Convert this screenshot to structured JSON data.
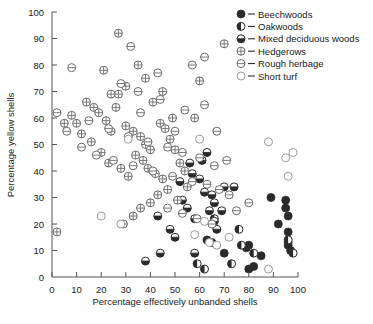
{
  "chart_data": {
    "type": "scatter",
    "title": "",
    "xlabel": "Percentage effectively unbanded shells",
    "ylabel": "Percentage yellow shells",
    "xlim": [
      0,
      100
    ],
    "ylim": [
      0,
      100
    ],
    "xticks": [
      0,
      10,
      20,
      30,
      40,
      50,
      60,
      70,
      80,
      90,
      100
    ],
    "yticks": [
      0,
      10,
      20,
      30,
      40,
      50,
      60,
      70,
      80,
      90,
      100
    ],
    "grid": false,
    "legend_position": "top-right",
    "series": [
      {
        "name": "Beechwoods",
        "marker": "filled-circle",
        "color": "#2b2b2b",
        "points": [
          [
            89,
            30
          ],
          [
            95,
            29
          ],
          [
            95,
            26
          ],
          [
            96,
            23
          ],
          [
            92,
            20
          ],
          [
            96,
            17
          ],
          [
            96,
            13
          ],
          [
            96,
            12
          ],
          [
            97,
            10
          ],
          [
            80,
            12
          ],
          [
            79,
            11
          ],
          [
            70,
            9
          ],
          [
            85,
            8
          ],
          [
            82,
            4
          ],
          [
            80,
            3
          ],
          [
            63,
            14
          ],
          [
            65,
            13
          ]
        ]
      },
      {
        "name": "Oakwoods",
        "marker": "half-left-circle",
        "color": "#2b2b2b",
        "points": [
          [
            76,
            18
          ],
          [
            77,
            12
          ],
          [
            82,
            9
          ],
          [
            73,
            5
          ],
          [
            62,
            3
          ],
          [
            66,
            22
          ],
          [
            59,
            5
          ],
          [
            96,
            14
          ],
          [
            98,
            9
          ]
        ]
      },
      {
        "name": "Mixed deciduous woods",
        "marker": "half-bottom-circle",
        "color": "#2b2b2b",
        "points": [
          [
            60,
            37
          ],
          [
            62,
            32
          ],
          [
            65,
            31
          ],
          [
            66,
            28
          ],
          [
            64,
            25
          ],
          [
            58,
            22
          ],
          [
            66,
            21
          ],
          [
            67,
            18
          ],
          [
            69,
            25
          ],
          [
            70,
            34
          ],
          [
            56,
            43
          ],
          [
            57,
            39
          ],
          [
            52,
            36
          ],
          [
            53,
            29
          ],
          [
            55,
            26
          ],
          [
            48,
            18
          ],
          [
            50,
            15
          ],
          [
            44,
            9
          ],
          [
            58,
            9
          ],
          [
            43,
            23
          ],
          [
            74,
            34
          ],
          [
            63,
            47
          ],
          [
            38,
            6
          ],
          [
            61,
            44
          ]
        ]
      },
      {
        "name": "Hedgerows",
        "marker": "crossed-circle",
        "color": "#6b6b6b",
        "points": [
          [
            27,
            92
          ],
          [
            35,
            80
          ],
          [
            30,
            72
          ],
          [
            27,
            69
          ],
          [
            24,
            69
          ],
          [
            5,
            58
          ],
          [
            2,
            17
          ],
          [
            10,
            58
          ],
          [
            14,
            66
          ],
          [
            17,
            64
          ],
          [
            19,
            62
          ],
          [
            22,
            59
          ],
          [
            24,
            55
          ],
          [
            30,
            57
          ],
          [
            33,
            55
          ],
          [
            36,
            53
          ],
          [
            38,
            50
          ],
          [
            40,
            48
          ],
          [
            44,
            58
          ],
          [
            46,
            56
          ],
          [
            48,
            52
          ],
          [
            50,
            48
          ],
          [
            34,
            46
          ],
          [
            37,
            44
          ],
          [
            39,
            41
          ],
          [
            42,
            39
          ],
          [
            45,
            37
          ],
          [
            31,
            38
          ],
          [
            28,
            41
          ],
          [
            23,
            43
          ],
          [
            20,
            47
          ],
          [
            16,
            51
          ],
          [
            12,
            54
          ],
          [
            8,
            61
          ],
          [
            52,
            43
          ],
          [
            54,
            40
          ],
          [
            47,
            33
          ],
          [
            43,
            31
          ],
          [
            40,
            28
          ],
          [
            36,
            26
          ],
          [
            33,
            23
          ],
          [
            29,
            20
          ],
          [
            26,
            64
          ],
          [
            49,
            60
          ],
          [
            55,
            34
          ],
          [
            51,
            29
          ],
          [
            58,
            60
          ],
          [
            41,
            66
          ],
          [
            45,
            70
          ],
          [
            38,
            75
          ],
          [
            21,
            78
          ],
          [
            70,
            88
          ],
          [
            60,
            74
          ]
        ]
      },
      {
        "name": "Rough herbage",
        "marker": "dotted-circle",
        "color": "#6b6b6b",
        "points": [
          [
            8,
            79
          ],
          [
            32,
            87
          ],
          [
            62,
            83
          ],
          [
            57,
            80
          ],
          [
            43,
            77
          ],
          [
            2,
            62
          ],
          [
            6,
            55
          ],
          [
            12,
            49
          ],
          [
            18,
            46
          ],
          [
            25,
            44
          ],
          [
            33,
            42
          ],
          [
            41,
            40
          ],
          [
            49,
            38
          ],
          [
            57,
            36
          ],
          [
            63,
            35
          ],
          [
            68,
            33
          ],
          [
            72,
            31
          ],
          [
            66,
            42
          ],
          [
            60,
            45
          ],
          [
            53,
            47
          ],
          [
            47,
            49
          ],
          [
            39,
            51
          ],
          [
            31,
            53
          ],
          [
            23,
            56
          ],
          [
            15,
            59
          ],
          [
            54,
            63
          ],
          [
            62,
            65
          ],
          [
            44,
            67
          ],
          [
            35,
            70
          ],
          [
            28,
            73
          ],
          [
            47,
            26
          ],
          [
            53,
            24
          ],
          [
            59,
            22
          ],
          [
            65,
            20
          ],
          [
            71,
            44
          ],
          [
            75,
            25
          ],
          [
            80,
            28
          ],
          [
            36,
            62
          ],
          [
            50,
            55
          ],
          [
            67,
            55
          ]
        ]
      },
      {
        "name": "Short turf",
        "marker": "open-circle",
        "color": "#9a9a9a",
        "points": [
          [
            20,
            23
          ],
          [
            31,
            52
          ],
          [
            60,
            52
          ],
          [
            88,
            51
          ],
          [
            95,
            45
          ],
          [
            98,
            47
          ],
          [
            96,
            38
          ],
          [
            28,
            20
          ],
          [
            62,
            21
          ],
          [
            64,
            13
          ],
          [
            67,
            12
          ],
          [
            88,
            3
          ],
          [
            58,
            16
          ],
          [
            72,
            15
          ]
        ]
      }
    ]
  },
  "legend": {
    "items": [
      {
        "label": "Beechwoods",
        "marker": "filled-circle"
      },
      {
        "label": "Oakwoods",
        "marker": "half-left-circle"
      },
      {
        "label": "Mixed deciduous woods",
        "marker": "half-bottom-circle"
      },
      {
        "label": "Hedgerows",
        "marker": "crossed-circle"
      },
      {
        "label": "Rough herbage",
        "marker": "dotted-circle"
      },
      {
        "label": "Short turf",
        "marker": "open-circle"
      }
    ]
  }
}
